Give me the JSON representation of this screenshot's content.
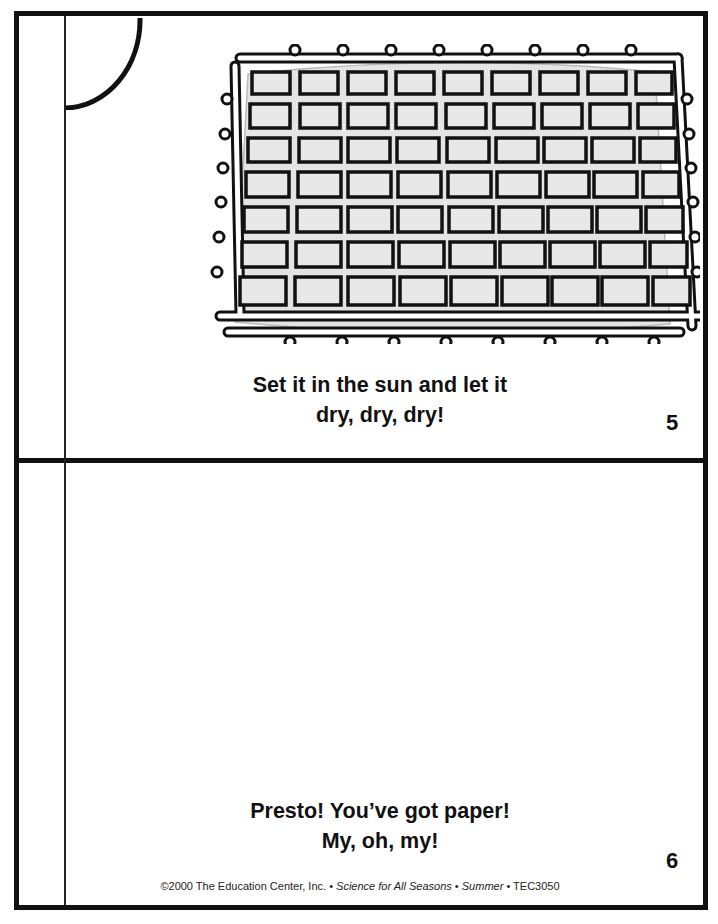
{
  "panels": [
    {
      "id": "top",
      "caption_lines": [
        "Set it in the sun and let it",
        "dry, dry, dry!"
      ],
      "page_number": "5",
      "illustration": "paper drying on a wire screen grid"
    },
    {
      "id": "bottom",
      "caption_lines": [
        "Presto! You’ve got paper!",
        "My, oh, my!"
      ],
      "page_number": "6"
    }
  ],
  "credit": {
    "copyright": "©2000 The Education Center, Inc. • ",
    "book_title": "Science for All Seasons",
    "sep1": " • ",
    "season": "Summer",
    "sep2": " • TEC3050"
  },
  "colors": {
    "ink": "#111111",
    "paper": "#ffffff",
    "screen_fill": "#e6e6e6"
  }
}
